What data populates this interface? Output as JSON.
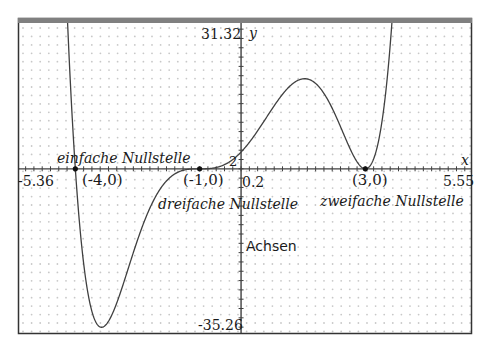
{
  "chart_data": {
    "type": "line",
    "title": "",
    "xlabel": "x",
    "ylabel": "y",
    "xlim": [
      -5.36,
      5.55
    ],
    "ylim": [
      -35.26,
      31.32
    ],
    "grid": "dots",
    "function": "f(x) = 0.1*(x+4)*(x+1)^3*(x-3)^2",
    "function_coeffs": {
      "a": 0.1,
      "roots": [
        [
          -4,
          1
        ],
        [
          -1,
          3
        ],
        [
          3,
          2
        ]
      ]
    },
    "axis_labels": {
      "x_min": "-5.36",
      "x_max": "5.55",
      "y_max": "31.32",
      "y_min": "-35.26",
      "x_tick_label": "0.2",
      "y_tick_label": "2",
      "x_axis_name": "x",
      "y_axis_name": "y"
    },
    "points": [
      {
        "x": -4,
        "y": 0,
        "label": "(-4,0)",
        "annotation": "einfache Nullstelle"
      },
      {
        "x": -1,
        "y": 0,
        "label": "(-1,0)",
        "annotation": "dreifache Nullstelle"
      },
      {
        "x": 3,
        "y": 0,
        "label": "(3,0)",
        "annotation": "zweifache Nullstelle"
      }
    ],
    "annotations": [
      "Achsen"
    ]
  },
  "labels": {
    "y_max": "31.32",
    "y_min": "-35.26",
    "x_min": "-5.36",
    "x_max": "5.55",
    "x_tick": "0.2",
    "y_tick": "2",
    "x_name": "x",
    "y_name": "y",
    "p1": "(-4,0)",
    "p2": "(-1,0)",
    "p3": "(3,0)",
    "note1": "einfache Nullstelle",
    "note2": "dreifache Nullstelle",
    "note3": "zweifache Nullstelle",
    "axes": "Achsen"
  },
  "colors": {
    "frame": "#333333",
    "top_bar": "#808080",
    "curve": "#404040",
    "axis": "#404040",
    "grid_dot": "#c8c8c8"
  }
}
